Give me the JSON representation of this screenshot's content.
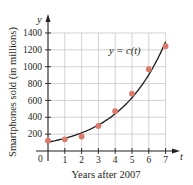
{
  "chart_data": {
    "type": "scatter",
    "title": "",
    "xlabel": "Years after 2007",
    "ylabel": "Smartphones sold (in millions)",
    "x_axis_var": "t",
    "y_axis_var": "y",
    "curve_label": "y = c(t)",
    "x": [
      0,
      1,
      2,
      3,
      4,
      5,
      6,
      7
    ],
    "series": [
      {
        "name": "data points",
        "kind": "scatter",
        "values": [
          122,
          139,
          172,
          297,
          472,
          680,
          970,
          1244
        ]
      },
      {
        "name": "y = c(t)",
        "kind": "exponential curve",
        "values": [
          105,
          160,
          235,
          340,
          490,
          690,
          960,
          1300
        ]
      }
    ],
    "x_ticks": [
      "0",
      "1",
      "2",
      "3",
      "4",
      "5",
      "6",
      "7"
    ],
    "y_ticks": [
      "200",
      "400",
      "600",
      "800",
      "1000",
      "1200",
      "1400"
    ],
    "xlim": [
      0,
      7.4
    ],
    "ylim": [
      0,
      1450
    ],
    "grid": true,
    "legend": "none",
    "colors": {
      "points": "#d97a6a",
      "curve": "#1a1a1a",
      "grid": "#c8c8c8",
      "axis": "#231f20"
    }
  }
}
